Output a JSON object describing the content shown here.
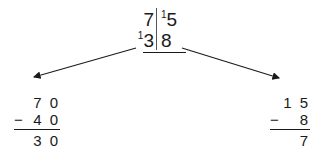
{
  "diagram": {
    "colors": {
      "ink": "#1a1a1a",
      "rule": "#555555",
      "background": "#ffffff"
    },
    "division": {
      "top_row": {
        "dividend_part": "7",
        "carry": "1",
        "quotient_part": "5"
      },
      "bottom_row": {
        "carry": "1",
        "left_digit": "3",
        "right_digit": "8"
      }
    },
    "arrows": [
      {
        "name": "arrow-left",
        "direction": "down-left"
      },
      {
        "name": "arrow-right",
        "direction": "down-right"
      }
    ],
    "calc_left": {
      "minuend": "7 0",
      "operator": "−",
      "subtrahend": "4 0",
      "result": "3 0"
    },
    "calc_right": {
      "minuend": "1 5",
      "operator": "−",
      "subtrahend": "8",
      "result": "7"
    }
  }
}
